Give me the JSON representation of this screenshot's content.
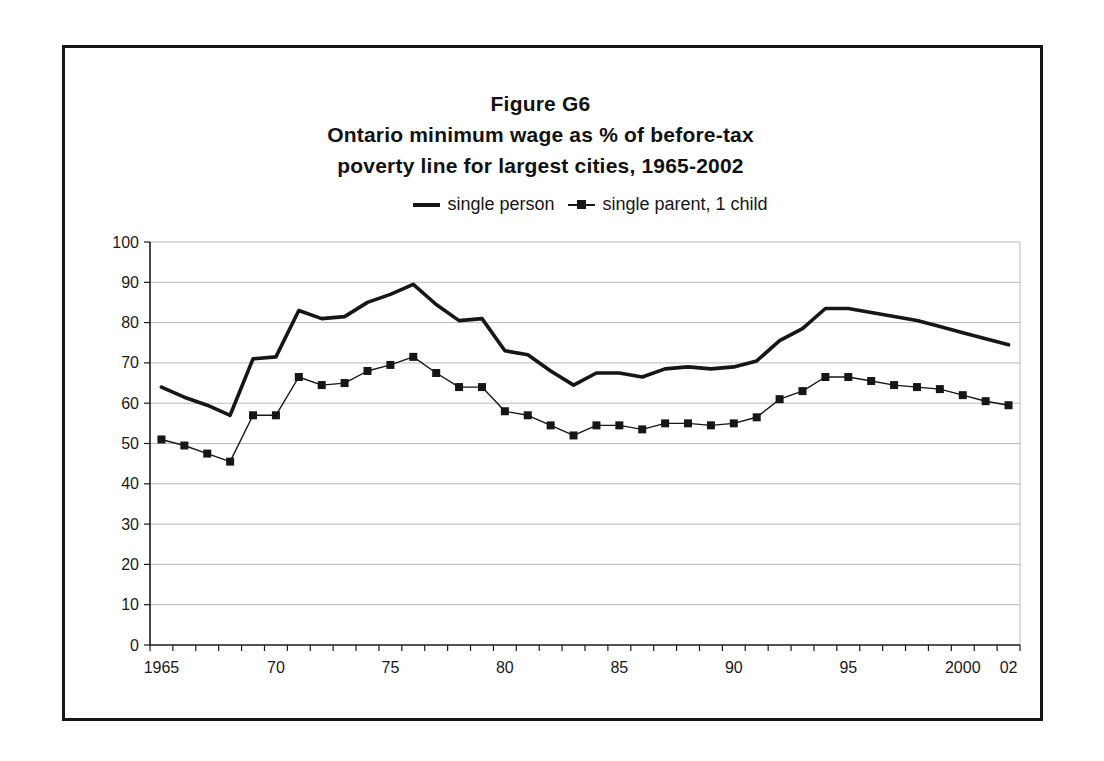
{
  "title": {
    "line1": "Figure G6",
    "line2": "Ontario minimum wage as % of before-tax",
    "line3": "poverty line for largest cities, 1965-2002"
  },
  "legend": {
    "items": [
      {
        "label": "single person",
        "swatch": "thick-solid-line"
      },
      {
        "label": "single parent, 1 child",
        "swatch": "thin-line-square-marker"
      }
    ]
  },
  "chart_data": {
    "type": "line",
    "title": "Figure G6 Ontario minimum wage as % of before-tax poverty line for largest cities, 1965-2002",
    "xlabel": "",
    "ylabel": "",
    "ylim": [
      0,
      100
    ],
    "y_tick_step": 10,
    "y_tick_labels": [
      "0",
      "10",
      "20",
      "30",
      "40",
      "50",
      "60",
      "70",
      "80",
      "90",
      "100"
    ],
    "grid": "horizontal",
    "legend_position": "top-center",
    "x": [
      1965,
      1966,
      1967,
      1968,
      1969,
      1970,
      1971,
      1972,
      1973,
      1974,
      1975,
      1976,
      1977,
      1978,
      1979,
      1980,
      1981,
      1982,
      1983,
      1984,
      1985,
      1986,
      1987,
      1988,
      1989,
      1990,
      1991,
      1992,
      1993,
      1994,
      1995,
      1996,
      1997,
      1998,
      1999,
      2000,
      2001,
      2002
    ],
    "x_ticks": [
      {
        "year": 1965,
        "label": "1965"
      },
      {
        "year": 1970,
        "label": "70"
      },
      {
        "year": 1975,
        "label": "75"
      },
      {
        "year": 1980,
        "label": "80"
      },
      {
        "year": 1985,
        "label": "85"
      },
      {
        "year": 1990,
        "label": "90"
      },
      {
        "year": 1995,
        "label": "95"
      },
      {
        "year": 2000,
        "label": "2000"
      },
      {
        "year": 2002,
        "label": "02"
      }
    ],
    "series": [
      {
        "name": "single person",
        "marker": "none",
        "line_width": 3.6,
        "values": [
          64,
          61.5,
          59.5,
          57,
          71,
          71.5,
          83,
          81,
          81.5,
          85,
          87,
          89.5,
          84.5,
          80.5,
          81,
          73,
          72,
          68,
          64.5,
          67.5,
          67.5,
          66.5,
          68.5,
          69,
          68.5,
          69,
          70.5,
          75.5,
          78.5,
          83.5,
          83.5,
          82.5,
          81.5,
          80.5,
          79,
          77.5,
          76,
          74.5
        ]
      },
      {
        "name": "single parent, 1 child",
        "marker": "square",
        "line_width": 1.4,
        "values": [
          51,
          49.5,
          47.5,
          45.5,
          57,
          57,
          66.5,
          64.5,
          65,
          68,
          69.5,
          71.5,
          67.5,
          64,
          64,
          58,
          57,
          54.5,
          52,
          54.5,
          54.5,
          53.5,
          55,
          55,
          54.5,
          55,
          56.5,
          61,
          63,
          66.5,
          66.5,
          65.5,
          64.5,
          64,
          63.5,
          62,
          60.5,
          59.5
        ]
      }
    ],
    "colors": {
      "line": "#161616",
      "grid": "#b9b9b9",
      "axis": "#1a1a1a",
      "background": "#ffffff"
    }
  }
}
